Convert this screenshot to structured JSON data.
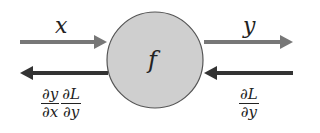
{
  "diagram": {
    "node": {
      "label": "f",
      "fill": "#cfcfcf",
      "stroke": "#555555"
    },
    "forward": {
      "input_label": "x",
      "output_label": "y",
      "color": "#777777"
    },
    "backward": {
      "input_grad": {
        "num": "∂L",
        "den": "∂y"
      },
      "output_grad": [
        {
          "num": "∂y",
          "den": "∂x"
        },
        {
          "num": "∂L",
          "den": "∂y"
        }
      ],
      "color": "#333333"
    }
  }
}
